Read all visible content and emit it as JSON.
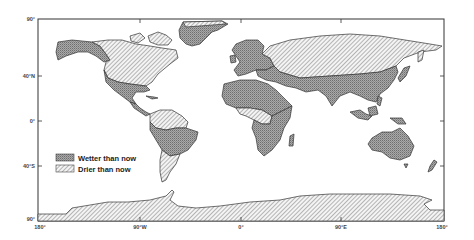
{
  "map": {
    "type": "world-climate-anomaly-map",
    "projection": "equirectangular",
    "latitude_ticks": [
      {
        "label": "90°",
        "lat": 90
      },
      {
        "label": "40°N",
        "lat": 40
      },
      {
        "label": "0°",
        "lat": 0
      },
      {
        "label": "40°S",
        "lat": -40
      },
      {
        "label": "90°",
        "lat": -90
      }
    ],
    "longitude_ticks": [
      {
        "label": "180°",
        "lon": -180
      },
      {
        "label": "90°W",
        "lon": -90
      },
      {
        "label": "0°",
        "lon": 0
      },
      {
        "label": "90°E",
        "lon": 90
      },
      {
        "label": "180°",
        "lon": 180
      }
    ],
    "legend": {
      "placement": "left-center",
      "items": [
        {
          "label": "Wetter than now",
          "pattern": "cross-hatch-dense"
        },
        {
          "label": "Drier than now",
          "pattern": "diagonal-hatch"
        }
      ]
    },
    "regions": [
      {
        "name": "Alaska & northwestern North America",
        "category": "wetter"
      },
      {
        "name": "Canada & northern USA",
        "category": "drier"
      },
      {
        "name": "Southern USA & Mexico",
        "category": "wetter"
      },
      {
        "name": "Central America",
        "category": "wetter"
      },
      {
        "name": "Greenland",
        "category": "wetter"
      },
      {
        "name": "Northern South America (Amazon)",
        "category": "drier"
      },
      {
        "name": "Central South America",
        "category": "wetter"
      },
      {
        "name": "Southern South America (Patagonia)",
        "category": "drier"
      },
      {
        "name": "Europe & Scandinavia",
        "category": "wetter"
      },
      {
        "name": "Siberia & northern Asia",
        "category": "drier"
      },
      {
        "name": "Middle East & southern Asia",
        "category": "wetter"
      },
      {
        "name": "North Africa / Sahara",
        "category": "wetter"
      },
      {
        "name": "Central Africa",
        "category": "drier"
      },
      {
        "name": "Southern Africa",
        "category": "wetter"
      },
      {
        "name": "Madagascar",
        "category": "wetter"
      },
      {
        "name": "Southeast Asia & Indonesia",
        "category": "wetter"
      },
      {
        "name": "Australia",
        "category": "wetter"
      },
      {
        "name": "New Zealand",
        "category": "wetter"
      },
      {
        "name": "Antarctica",
        "category": "drier"
      }
    ]
  }
}
